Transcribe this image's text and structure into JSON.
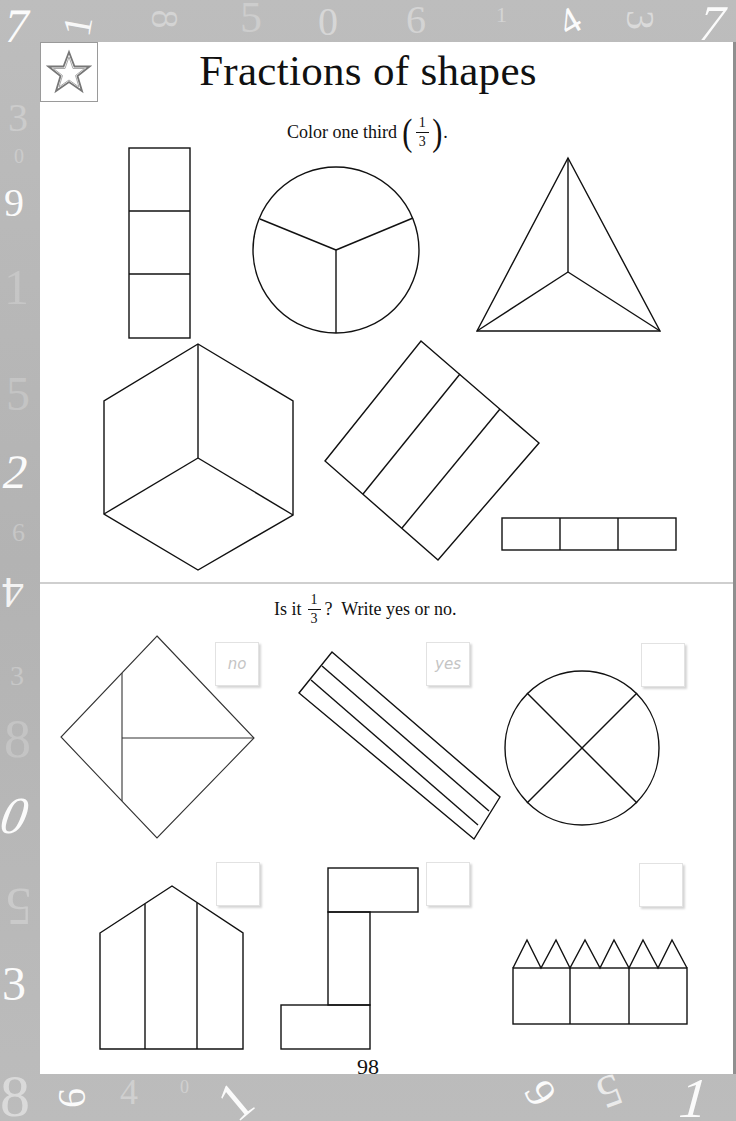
{
  "page": {
    "title": "Fractions of shapes",
    "page_number": "98",
    "star_icon": "star-icon"
  },
  "section1": {
    "instruction_prefix": "Color one third",
    "fraction": {
      "numerator": "1",
      "denominator": "3"
    },
    "instruction_suffix": ".",
    "shapes": [
      "vertical-rectangle-3-parts",
      "circle-3-parts",
      "triangle-3-parts",
      "hexagon-3-parts",
      "tilted-rectangle-3-parts",
      "horizontal-rectangle-3-parts"
    ]
  },
  "section2": {
    "instruction_prefix": "Is it",
    "fraction": {
      "numerator": "1",
      "denominator": "3"
    },
    "instruction_suffix": "?  Write yes or no.",
    "items": [
      {
        "shape": "diamond-3-parts-unequal",
        "answer": "no"
      },
      {
        "shape": "diagonal-strip-3-parts",
        "answer": "yes"
      },
      {
        "shape": "circle-4-parts",
        "answer": ""
      },
      {
        "shape": "house-3-parts",
        "answer": ""
      },
      {
        "shape": "z-shape-3-parts",
        "answer": ""
      },
      {
        "shape": "crown-3-parts",
        "answer": ""
      }
    ]
  },
  "border_numbers": {
    "top": [
      "7",
      "1",
      "8",
      "5",
      "0",
      "6",
      "1",
      "4",
      "3",
      "7"
    ],
    "left": [
      "3",
      "0",
      "9",
      "1",
      "5",
      "2",
      "6",
      "4",
      "3",
      "8",
      "0",
      "5",
      "3"
    ],
    "bottom": [
      "8",
      "6",
      "4",
      "0",
      "1",
      "9",
      "5",
      "1"
    ]
  },
  "colors": {
    "border": "#b9b9b9",
    "page": "#ffffff",
    "ink": "#111111",
    "answer_text": "#c4c4c4"
  }
}
